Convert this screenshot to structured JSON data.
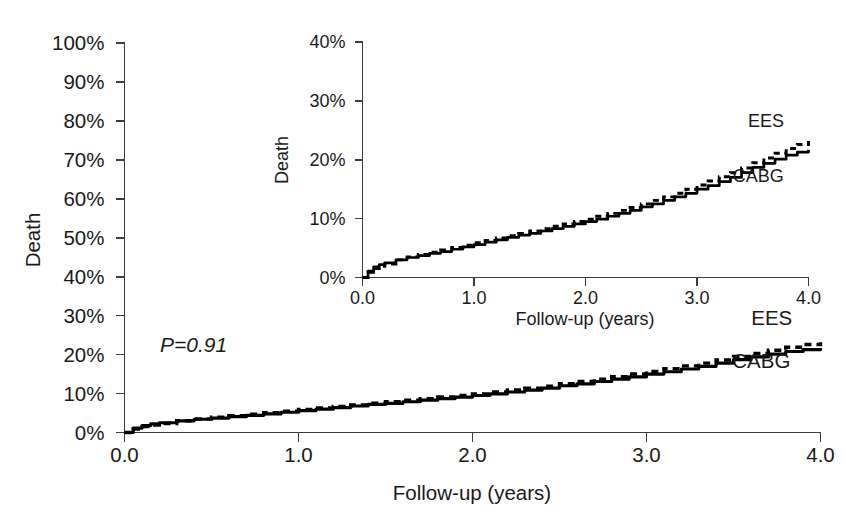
{
  "chart_data": [
    {
      "id": "main",
      "type": "line",
      "title": "",
      "xlabel": "Follow-up (years)",
      "ylabel": "Death",
      "xlim": [
        0.0,
        4.0
      ],
      "ylim": [
        0,
        100
      ],
      "xticks": [
        "0.0",
        "1.0",
        "2.0",
        "3.0",
        "4.0"
      ],
      "xtick_values": [
        0.0,
        1.0,
        2.0,
        3.0,
        4.0
      ],
      "yticks": [
        "0%",
        "10%",
        "20%",
        "30%",
        "40%",
        "50%",
        "60%",
        "70%",
        "80%",
        "90%",
        "100%"
      ],
      "ytick_values": [
        0,
        10,
        20,
        30,
        40,
        50,
        60,
        70,
        80,
        90,
        100
      ],
      "grid": false,
      "legend_position": "inline-right",
      "annotations": [
        {
          "name": "p-value",
          "text": "P=0.91",
          "x": 0.55,
          "y": 22.5
        }
      ],
      "series": [
        {
          "name": "EES",
          "style": "dashed",
          "label_x": 3.72,
          "label_y": 27.5,
          "x": [
            0.0,
            0.05,
            0.1,
            0.15,
            0.2,
            0.3,
            0.4,
            0.5,
            0.6,
            0.7,
            0.8,
            0.9,
            1.0,
            1.1,
            1.2,
            1.3,
            1.4,
            1.5,
            1.6,
            1.7,
            1.8,
            1.9,
            2.0,
            2.1,
            2.2,
            2.3,
            2.4,
            2.5,
            2.6,
            2.7,
            2.8,
            2.9,
            3.0,
            3.1,
            3.2,
            3.3,
            3.4,
            3.5,
            3.6,
            3.7,
            3.8,
            3.9,
            4.0
          ],
          "y": [
            0.0,
            0.9,
            1.5,
            1.9,
            2.3,
            3.0,
            3.5,
            3.9,
            4.3,
            4.7,
            5.1,
            5.5,
            5.9,
            6.3,
            6.7,
            7.1,
            7.5,
            7.9,
            8.3,
            8.7,
            9.1,
            9.5,
            9.9,
            10.4,
            10.9,
            11.4,
            11.9,
            12.5,
            13.1,
            13.7,
            14.3,
            15.0,
            15.7,
            16.4,
            17.1,
            17.8,
            18.6,
            19.5,
            20.3,
            21.1,
            21.9,
            22.6,
            23.2
          ]
        },
        {
          "name": "CABG",
          "style": "solid",
          "label_x": 3.66,
          "label_y": 16.5,
          "x": [
            0.0,
            0.05,
            0.1,
            0.15,
            0.2,
            0.3,
            0.4,
            0.5,
            0.6,
            0.7,
            0.8,
            0.9,
            1.0,
            1.1,
            1.2,
            1.3,
            1.4,
            1.5,
            1.6,
            1.7,
            1.8,
            1.9,
            2.0,
            2.1,
            2.2,
            2.3,
            2.4,
            2.5,
            2.6,
            2.7,
            2.8,
            2.9,
            3.0,
            3.1,
            3.2,
            3.3,
            3.4,
            3.5,
            3.6,
            3.7,
            3.8,
            3.9,
            4.0
          ],
          "y": [
            0.0,
            1.1,
            1.8,
            2.2,
            2.5,
            3.0,
            3.4,
            3.7,
            4.1,
            4.4,
            4.8,
            5.2,
            5.6,
            6.0,
            6.4,
            6.8,
            7.2,
            7.5,
            7.9,
            8.3,
            8.7,
            9.1,
            9.5,
            9.9,
            10.4,
            10.9,
            11.4,
            12.0,
            12.5,
            13.1,
            13.7,
            14.3,
            15.0,
            15.6,
            16.3,
            17.0,
            17.8,
            18.7,
            19.4,
            20.1,
            20.8,
            21.3,
            21.7
          ]
        }
      ]
    },
    {
      "id": "inset",
      "type": "line",
      "title": "",
      "xlabel": "Follow-up (years)",
      "ylabel": "Death",
      "xlim": [
        0.0,
        4.0
      ],
      "ylim": [
        0,
        40
      ],
      "xticks": [
        "0.0",
        "1.0",
        "2.0",
        "3.0",
        "4.0"
      ],
      "xtick_values": [
        0.0,
        1.0,
        2.0,
        3.0,
        4.0
      ],
      "yticks": [
        "0%",
        "10%",
        "20%",
        "30%",
        "40%"
      ],
      "ytick_values": [
        0,
        10,
        20,
        30,
        40
      ],
      "grid": false,
      "legend_position": "inline-right",
      "annotations": [],
      "series": [
        {
          "name": "EES",
          "style": "dashed",
          "label_x": 3.62,
          "label_y": 25.6,
          "x": [
            0.0,
            0.05,
            0.1,
            0.15,
            0.2,
            0.3,
            0.4,
            0.5,
            0.6,
            0.7,
            0.8,
            0.9,
            1.0,
            1.1,
            1.2,
            1.3,
            1.4,
            1.5,
            1.6,
            1.7,
            1.8,
            1.9,
            2.0,
            2.1,
            2.2,
            2.3,
            2.4,
            2.5,
            2.6,
            2.7,
            2.8,
            2.9,
            3.0,
            3.1,
            3.2,
            3.3,
            3.4,
            3.5,
            3.6,
            3.7,
            3.8,
            3.9,
            4.0
          ],
          "y": [
            0.0,
            0.9,
            1.5,
            1.9,
            2.3,
            3.0,
            3.5,
            3.9,
            4.3,
            4.7,
            5.1,
            5.5,
            5.9,
            6.3,
            6.7,
            7.1,
            7.5,
            7.9,
            8.3,
            8.7,
            9.1,
            9.5,
            9.9,
            10.4,
            10.9,
            11.4,
            11.9,
            12.5,
            13.1,
            13.7,
            14.3,
            15.0,
            15.7,
            16.4,
            17.1,
            17.8,
            18.6,
            19.5,
            20.3,
            21.1,
            21.9,
            22.6,
            23.2
          ]
        },
        {
          "name": "CABG",
          "style": "solid",
          "label_x": 3.55,
          "label_y": 16.2,
          "x": [
            0.0,
            0.05,
            0.1,
            0.15,
            0.2,
            0.3,
            0.4,
            0.5,
            0.6,
            0.7,
            0.8,
            0.9,
            1.0,
            1.1,
            1.2,
            1.3,
            1.4,
            1.5,
            1.6,
            1.7,
            1.8,
            1.9,
            2.0,
            2.1,
            2.2,
            2.3,
            2.4,
            2.5,
            2.6,
            2.7,
            2.8,
            2.9,
            3.0,
            3.1,
            3.2,
            3.3,
            3.4,
            3.5,
            3.6,
            3.7,
            3.8,
            3.9,
            4.0
          ],
          "y": [
            0.0,
            1.1,
            1.8,
            2.2,
            2.5,
            3.0,
            3.4,
            3.7,
            4.1,
            4.4,
            4.8,
            5.2,
            5.6,
            6.0,
            6.4,
            6.8,
            7.2,
            7.5,
            7.9,
            8.3,
            8.7,
            9.1,
            9.5,
            9.9,
            10.4,
            10.9,
            11.4,
            12.0,
            12.5,
            13.1,
            13.7,
            14.3,
            15.0,
            15.6,
            16.3,
            17.0,
            17.8,
            18.7,
            19.4,
            20.1,
            20.8,
            21.3,
            21.7
          ]
        }
      ]
    }
  ],
  "colors": {
    "background": "#ffffff",
    "axis": "#3c3c3c",
    "curve": "#000000",
    "text": "#1a1a1a"
  }
}
